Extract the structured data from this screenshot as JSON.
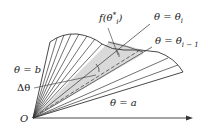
{
  "diagram": {
    "labels": {
      "f_theta_star": "f(θ",
      "f_theta_star_sub": "i",
      "f_theta_star_sup": "*",
      "f_theta_star_close": ")",
      "theta_i": "θ = θ",
      "theta_i_sub": "i",
      "theta_i_minus_1": "θ = θ",
      "theta_i_minus_1_sub": "i − 1",
      "theta_b": "θ = b",
      "delta_theta": "Δθ",
      "theta_a": "θ = a",
      "origin": "O"
    },
    "colors": {
      "line": "#333333",
      "shade": "#d9d9d9",
      "text": "#222222"
    }
  }
}
